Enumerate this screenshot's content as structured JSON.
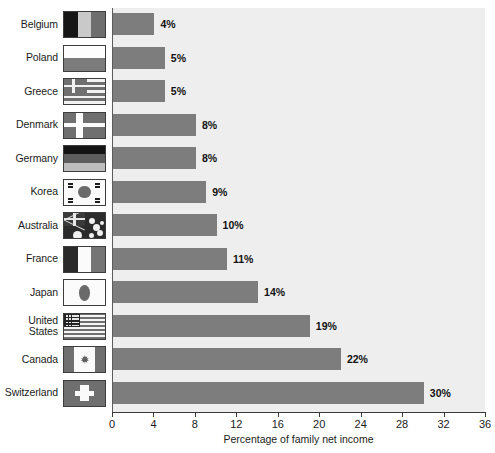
{
  "chart_data": {
    "type": "bar",
    "orientation": "horizontal",
    "title": "",
    "xlabel": "Percentage of family net income",
    "ylabel": "",
    "xlim": [
      0,
      36
    ],
    "xticks": [
      0,
      4,
      8,
      12,
      16,
      20,
      24,
      28,
      32,
      36
    ],
    "grid": false,
    "legend": null,
    "categories": [
      "Belgium",
      "Poland",
      "Greece",
      "Denmark",
      "Germany",
      "Korea",
      "Australia",
      "France",
      "Japan",
      "United States",
      "Canada",
      "Switzerland"
    ],
    "values": [
      4,
      5,
      5,
      8,
      8,
      9,
      10,
      11,
      14,
      19,
      22,
      30
    ],
    "data_labels": [
      "4%",
      "5%",
      "5%",
      "8%",
      "8%",
      "9%",
      "10%",
      "11%",
      "14%",
      "19%",
      "22%",
      "30%"
    ]
  },
  "rows": [
    {
      "country": "Belgium",
      "country_line1": "Belgium",
      "country_line2": "",
      "value": 4,
      "label": "4%",
      "flag": "flag-belgium"
    },
    {
      "country": "Poland",
      "country_line1": "Poland",
      "country_line2": "",
      "value": 5,
      "label": "5%",
      "flag": "flag-poland"
    },
    {
      "country": "Greece",
      "country_line1": "Greece",
      "country_line2": "",
      "value": 5,
      "label": "5%",
      "flag": "flag-greece"
    },
    {
      "country": "Denmark",
      "country_line1": "Denmark",
      "country_line2": "",
      "value": 8,
      "label": "8%",
      "flag": "flag-denmark"
    },
    {
      "country": "Germany",
      "country_line1": "Germany",
      "country_line2": "",
      "value": 8,
      "label": "8%",
      "flag": "flag-germany"
    },
    {
      "country": "Korea",
      "country_line1": "Korea",
      "country_line2": "",
      "value": 9,
      "label": "9%",
      "flag": "flag-korea"
    },
    {
      "country": "Australia",
      "country_line1": "Australia",
      "country_line2": "",
      "value": 10,
      "label": "10%",
      "flag": "flag-australia"
    },
    {
      "country": "France",
      "country_line1": "France",
      "country_line2": "",
      "value": 11,
      "label": "11%",
      "flag": "flag-france"
    },
    {
      "country": "Japan",
      "country_line1": "Japan",
      "country_line2": "",
      "value": 14,
      "label": "14%",
      "flag": "flag-japan"
    },
    {
      "country": "United States",
      "country_line1": "United",
      "country_line2": "States",
      "value": 19,
      "label": "19%",
      "flag": "flag-united-states"
    },
    {
      "country": "Canada",
      "country_line1": "Canada",
      "country_line2": "",
      "value": 22,
      "label": "22%",
      "flag": "flag-canada"
    },
    {
      "country": "Switzerland",
      "country_line1": "Switzerland",
      "country_line2": "",
      "value": 30,
      "label": "30%",
      "flag": "flag-switzerland"
    }
  ],
  "axis": {
    "title": "Percentage of family net income",
    "ticks": [
      "0",
      "4",
      "8",
      "12",
      "16",
      "20",
      "24",
      "28",
      "32",
      "36"
    ]
  },
  "colors": {
    "bar": "#7d7d7d",
    "plot_background": "#eeeeee",
    "page_background": "#ffffff",
    "axis": "#3a3a3a",
    "text": "#1b1b1b"
  }
}
